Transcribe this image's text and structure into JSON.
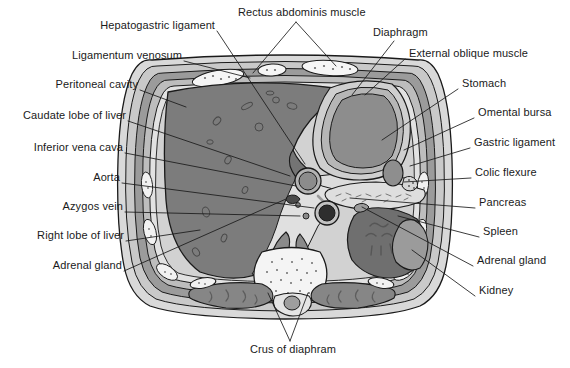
{
  "palette": {
    "background": "#ffffff",
    "skin_outer": "#d8d8d8",
    "fat_layer": "#c2c2c2",
    "muscle_wall": "#8e8e8e",
    "liver": "#7c7c7c",
    "stomach_lumen": "#8a8a8a",
    "spleen": "#6f6f6f",
    "kidney": "#6a6a6a",
    "pancreas": "#d6d6d6",
    "mesentery": "#cfcfcf",
    "bone_white": "#f4f4f4",
    "vessel_dark": "#3a3a3a",
    "outline": "#1a1a1a",
    "label_text": "#1a1a1a",
    "leader_line": "#1a1a1a"
  },
  "labels": {
    "left": [
      {
        "id": "hepatogastric-ligament",
        "text": "Hepatogastric ligament",
        "x": 93,
        "y": 25,
        "anchor_x": 217,
        "anchor_y": 31,
        "target_x": 305,
        "target_y": 164
      },
      {
        "id": "ligamentum-venosum",
        "text": "Ligamentum venosum",
        "x": 60,
        "y": 55,
        "anchor_x": 184,
        "anchor_y": 61,
        "target_x": 250,
        "target_y": 78
      },
      {
        "id": "peritoneal-cavity",
        "text": "Peritoneal cavity",
        "x": 35,
        "y": 84,
        "anchor_x": 140,
        "anchor_y": 90,
        "target_x": 186,
        "target_y": 107
      },
      {
        "id": "caudate-lobe-of-liver",
        "text": "Caudate lobe of liver",
        "x": 18,
        "y": 115,
        "anchor_x": 128,
        "anchor_y": 121,
        "target_x": 286,
        "target_y": 176
      },
      {
        "id": "inferior-vena-cava",
        "text": "Inferior vena cava",
        "x": 25,
        "y": 147,
        "anchor_x": 125,
        "anchor_y": 153,
        "target_x": 262,
        "target_y": 188
      },
      {
        "id": "aorta",
        "text": "Aorta",
        "x": 84,
        "y": 177,
        "anchor_x": 122,
        "anchor_y": 183,
        "target_x": 295,
        "target_y": 205
      },
      {
        "id": "azygos-vein",
        "text": "Azygos vein",
        "x": 54,
        "y": 206,
        "anchor_x": 125,
        "anchor_y": 212,
        "target_x": 290,
        "target_y": 216
      },
      {
        "id": "right-lobe-of-liver",
        "text": "Right lobe of liver",
        "x": 31,
        "y": 235,
        "anchor_x": 126,
        "anchor_y": 241,
        "target_x": 200,
        "target_y": 230
      },
      {
        "id": "adrenal-gland-left",
        "text": "Adrenal gland",
        "x": 45,
        "y": 265,
        "anchor_x": 124,
        "anchor_y": 271,
        "target_x": 255,
        "target_y": 238
      }
    ],
    "right": [
      {
        "id": "external-oblique-muscle",
        "text": "External oblique muscle",
        "x": 408,
        "y": 53,
        "anchor_x": 405,
        "anchor_y": 59,
        "target_x": 365,
        "target_y": 93
      },
      {
        "id": "stomach",
        "text": "Stomach",
        "x": 462,
        "y": 83,
        "anchor_x": 458,
        "anchor_y": 89,
        "target_x": 385,
        "target_y": 140
      },
      {
        "id": "omental-bursa",
        "text": "Omental bursa",
        "x": 478,
        "y": 112,
        "anchor_x": 474,
        "anchor_y": 118,
        "target_x": 405,
        "target_y": 149
      },
      {
        "id": "gastric-ligament",
        "text": "Gastric ligament",
        "x": 474,
        "y": 142,
        "anchor_x": 470,
        "anchor_y": 148,
        "target_x": 409,
        "target_y": 165
      },
      {
        "id": "colic-flexure",
        "text": "Colic flexure",
        "x": 475,
        "y": 172,
        "anchor_x": 471,
        "anchor_y": 178,
        "target_x": 408,
        "target_y": 186
      },
      {
        "id": "pancreas",
        "text": "Pancreas",
        "x": 479,
        "y": 202,
        "anchor_x": 475,
        "anchor_y": 208,
        "target_x": 338,
        "target_y": 200
      },
      {
        "id": "spleen",
        "text": "Spleen",
        "x": 483,
        "y": 231,
        "anchor_x": 479,
        "anchor_y": 237,
        "target_x": 395,
        "target_y": 218
      },
      {
        "id": "adrenal-gland-right",
        "text": "Adrenal gland",
        "x": 477,
        "y": 260,
        "anchor_x": 473,
        "anchor_y": 266,
        "target_x": 363,
        "target_y": 238
      },
      {
        "id": "kidney",
        "text": "Kidney",
        "x": 479,
        "y": 290,
        "anchor_x": 475,
        "anchor_y": 296,
        "target_x": 409,
        "target_y": 259
      }
    ],
    "top": [
      {
        "id": "rectus-abdominis-muscle",
        "text": "Rectus abdominis muscle",
        "x": 238,
        "y": 8,
        "anchor_x": 296,
        "anchor_y": 22,
        "targets": [
          {
            "x": 253,
            "y": 72
          },
          {
            "x": 330,
            "y": 66
          }
        ]
      },
      {
        "id": "diaphragm",
        "text": "Diaphragm",
        "x": 373,
        "y": 27,
        "anchor_x": 394,
        "anchor_y": 41,
        "target_x": 352,
        "target_y": 93
      }
    ],
    "bottom": [
      {
        "id": "crus-of-diaphram",
        "text": "Crus of diaphram",
        "x": 250,
        "y": 345,
        "anchor_x": 290,
        "anchor_y": 341,
        "targets": [
          {
            "x": 268,
            "y": 293
          },
          {
            "x": 306,
            "y": 293
          }
        ]
      }
    ]
  }
}
